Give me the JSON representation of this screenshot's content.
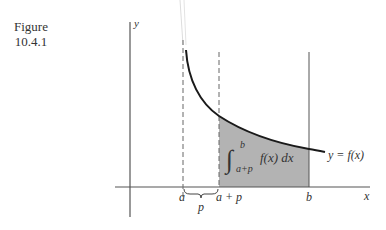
{
  "caption": {
    "line1": "Figure",
    "line2": "10.4.1"
  },
  "axes": {
    "x_label": "x",
    "y_label": "y"
  },
  "ticks": {
    "a": "a",
    "a_plus_p": "a + p",
    "b": "b",
    "p": "p"
  },
  "curve_label": "y = f(x)",
  "integral": {
    "upper_limit": "b",
    "lower_limit": "a+p",
    "integrand": "f(x) dx"
  },
  "colors": {
    "shade": "#b3b3b3",
    "curve": "#1a1a1a",
    "axis": "#555555"
  }
}
